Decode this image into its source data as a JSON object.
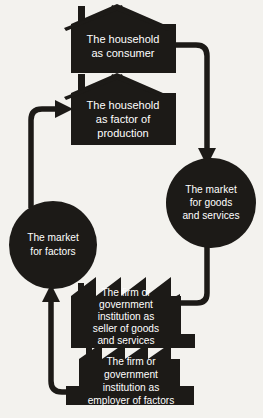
{
  "diagram": {
    "background_color": "#f3f2ee",
    "shape_color": "#1c1a17",
    "label_color": "#ffffff",
    "nodes": [
      {
        "id": "household-consumer",
        "shape": "house",
        "lines": [
          "The household",
          "as consumer"
        ]
      },
      {
        "id": "household-factor",
        "shape": "house",
        "lines": [
          "The household",
          "as factor of",
          "production"
        ]
      },
      {
        "id": "market-goods-services",
        "shape": "circle",
        "lines": [
          "The market",
          "for goods",
          "and services"
        ]
      },
      {
        "id": "market-factors",
        "shape": "circle",
        "lines": [
          "The market",
          "for factors"
        ]
      },
      {
        "id": "firm-seller",
        "shape": "factory",
        "lines": [
          "The firm or",
          "government",
          "institution as",
          "seller of goods",
          "and services"
        ]
      },
      {
        "id": "firm-employer",
        "shape": "factory",
        "lines": [
          "The firm or",
          "government",
          "institution as",
          "employer of factors"
        ]
      }
    ],
    "connectors": [
      {
        "id": "consumer-to-goods-market",
        "from": "household-consumer",
        "to": "market-goods-services",
        "direction": "down"
      },
      {
        "id": "goods-market-to-seller",
        "from": "market-goods-services",
        "to": "firm-seller",
        "direction": "left"
      },
      {
        "id": "employer-to-factor-market",
        "from": "firm-employer",
        "to": "market-factors",
        "direction": "up"
      },
      {
        "id": "factor-market-to-household",
        "from": "market-factors",
        "to": "household-factor",
        "direction": "right"
      }
    ]
  }
}
